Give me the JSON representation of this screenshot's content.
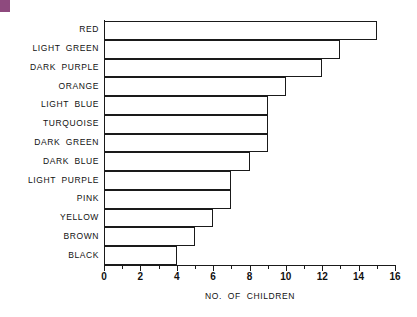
{
  "decoration": {
    "corner_swatch_color": "#8e4a7e",
    "corner_swatch_name": "purple-corner-swatch"
  },
  "axis": {
    "line_color": "#1a1a1a",
    "bar_outline_color": "#1a1a1a",
    "bar_fill_color": "#ffffff"
  },
  "chart_data": {
    "type": "bar",
    "orientation": "horizontal",
    "title": "",
    "xlabel": "NO. OF CHILDREN",
    "ylabel": "",
    "xlim": [
      0,
      16
    ],
    "xticks": [
      0,
      2,
      4,
      6,
      8,
      10,
      12,
      14,
      16
    ],
    "xtick_labels": [
      "0",
      "2",
      "4",
      "6",
      "8",
      "10",
      "12",
      "14",
      "16"
    ],
    "minor_tick_step": 1,
    "grid": false,
    "legend": null,
    "categories": [
      "RED",
      "LIGHT GREEN",
      "DARK PURPLE",
      "ORANGE",
      "LIGHT BLUE",
      "TURQUOISE",
      "DARK GREEN",
      "DARK BLUE",
      "LIGHT PURPLE",
      "PINK",
      "YELLOW",
      "BROWN",
      "BLACK"
    ],
    "values": [
      15,
      13,
      12,
      10,
      9,
      9,
      9,
      8,
      7,
      7,
      6,
      5,
      4
    ]
  }
}
